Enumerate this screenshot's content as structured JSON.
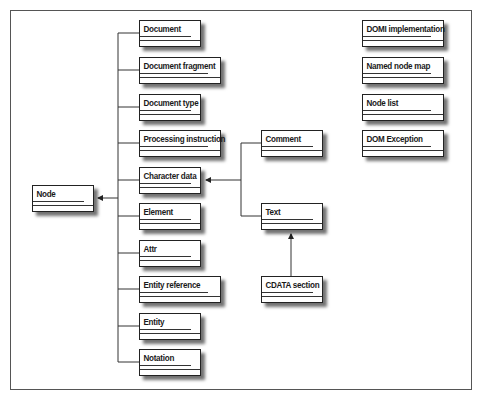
{
  "diagram": {
    "type": "class-hierarchy",
    "root": {
      "label": "Node"
    },
    "node_children": [
      {
        "label": "Document"
      },
      {
        "label": "Document fragment"
      },
      {
        "label": "Document type"
      },
      {
        "label": "Processing instruction"
      },
      {
        "label": "Character data"
      },
      {
        "label": "Element"
      },
      {
        "label": "Attr"
      },
      {
        "label": "Entity reference"
      },
      {
        "label": "Entity"
      },
      {
        "label": "Notation"
      }
    ],
    "character_data_children": [
      {
        "label": "Comment"
      },
      {
        "label": "Text"
      }
    ],
    "text_children": [
      {
        "label": "CDATA section"
      }
    ],
    "standalone": [
      {
        "label": "DOMI implementation"
      },
      {
        "label": "Named node map"
      },
      {
        "label": "Node list"
      },
      {
        "label": "DOM Exception"
      }
    ],
    "edges": [
      {
        "from": "Document",
        "to": "Node"
      },
      {
        "from": "Document fragment",
        "to": "Node"
      },
      {
        "from": "Document type",
        "to": "Node"
      },
      {
        "from": "Processing instruction",
        "to": "Node"
      },
      {
        "from": "Character data",
        "to": "Node"
      },
      {
        "from": "Element",
        "to": "Node"
      },
      {
        "from": "Attr",
        "to": "Node"
      },
      {
        "from": "Entity reference",
        "to": "Node"
      },
      {
        "from": "Entity",
        "to": "Node"
      },
      {
        "from": "Notation",
        "to": "Node"
      },
      {
        "from": "Comment",
        "to": "Character data"
      },
      {
        "from": "Text",
        "to": "Character data"
      },
      {
        "from": "CDATA section",
        "to": "Text"
      }
    ]
  }
}
